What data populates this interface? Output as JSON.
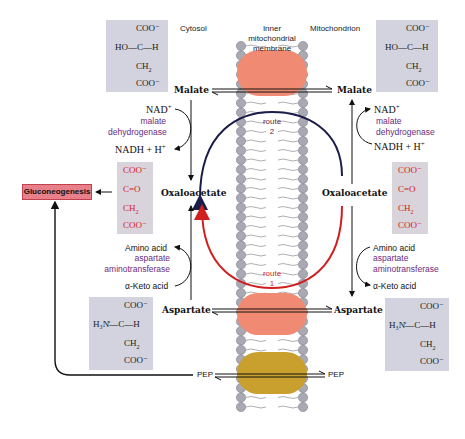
{
  "regions": {
    "cytosol": "Cytosol",
    "membrane_line1": "Inner",
    "membrane_line2": "mitochondrial",
    "membrane_line3": "membrane",
    "mitochondrion": "Mitochondrion"
  },
  "metabolites": {
    "malate_left": "Malate",
    "malate_right": "Malate",
    "oxaloacetate_left": "Oxaloacetate",
    "oxaloacetate_right": "Oxaloacetate",
    "aspartate_left": "Aspartate",
    "aspartate_right": "Aspartate",
    "pep_left": "PEP",
    "pep_right": "PEP"
  },
  "cofactors": {
    "nad_left": "NAD",
    "nadh_left": "NADH + H",
    "nad_right": "NAD",
    "nadh_right": "NADH + H",
    "plus": "+"
  },
  "enzymes": {
    "mdh_left_line1": "malate",
    "mdh_left_line2": "dehydrogenase",
    "mdh_right_line1": "malate",
    "mdh_right_line2": "dehydrogenase",
    "ast_left_line1": "aspartate",
    "ast_left_line2": "aminotransferase",
    "ast_right_line1": "aspartate",
    "ast_right_line2": "aminotransferase"
  },
  "transamination": {
    "amino_acid_left": "Amino acid",
    "keto_acid_left": "α-Keto acid",
    "amino_acid_right": "Amino acid",
    "keto_acid_right": "α-Keto acid"
  },
  "routes": {
    "route2_line1": "route",
    "route2_line2": "2",
    "route1_line1": "route",
    "route1_line2": "1"
  },
  "pathway": {
    "gluconeogenesis": "Gluconeogenesis"
  },
  "structures": {
    "malate": {
      "top": "COO⁻",
      "mid": "HO—C—H",
      "ch2": "CH",
      "bottom": "COO⁻"
    },
    "oxaloacetate": {
      "top": "COO⁻",
      "mid": "C=O",
      "ch2": "CH",
      "bottom": "COO⁻"
    },
    "aspartate": {
      "top": "COO⁻",
      "mid": "H₃N̊—C—H",
      "ch2": "CH",
      "bottom": "COO⁻"
    },
    "sub2": "2"
  },
  "colors": {
    "transporter_malate": "#f08a72",
    "transporter_aspartate": "#f08a72",
    "transporter_pep": "#c9a02e",
    "route1": "#d11f1f",
    "route2": "#1c1c4a",
    "enzyme_text": "#6a2c7e",
    "structure_bg": "#d2d3de",
    "gluconeogenesis_bg": "#e8808a",
    "lipid_head": "#a9a9b4"
  }
}
